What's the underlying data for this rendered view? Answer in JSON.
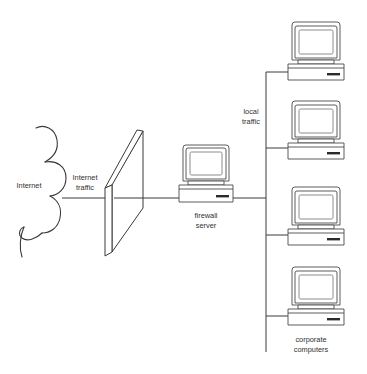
{
  "diagram": {
    "background_color": "#ffffff",
    "line_color": "#3a3a3a",
    "labels": {
      "internet": "Internet",
      "internet_traffic_line1": "Internet",
      "internet_traffic_line2": "traffic",
      "local_traffic_line1": "local",
      "local_traffic_line2": "traffic",
      "firewall_server_line1": "firewall",
      "firewall_server_line2": "server",
      "corporate_computers_line1": "corporate",
      "corporate_computers_line2": "computers"
    },
    "nodes": [
      {
        "id": "internet-cloud",
        "name": "Internet",
        "type": "cloud"
      },
      {
        "id": "firewall-wall",
        "name": "firewall barrier",
        "type": "wall"
      },
      {
        "id": "firewall-server",
        "name": "firewall server",
        "type": "computer"
      },
      {
        "id": "corporate-computer-1",
        "name": "corporate computer 1",
        "type": "computer"
      },
      {
        "id": "corporate-computer-2",
        "name": "corporate computer 2",
        "type": "computer"
      },
      {
        "id": "corporate-computer-3",
        "name": "corporate computer 3",
        "type": "computer"
      },
      {
        "id": "corporate-computer-4",
        "name": "corporate computer 4",
        "type": "computer"
      }
    ],
    "connections": [
      {
        "from": "internet-cloud",
        "to": "firewall-wall",
        "label": "Internet traffic"
      },
      {
        "from": "firewall-wall",
        "to": "firewall-server",
        "label": ""
      },
      {
        "from": "firewall-server",
        "to": "network-bus",
        "label": "local traffic"
      },
      {
        "from": "network-bus",
        "to": "corporate-computer-1",
        "label": ""
      },
      {
        "from": "network-bus",
        "to": "corporate-computer-2",
        "label": ""
      },
      {
        "from": "network-bus",
        "to": "corporate-computer-3",
        "label": ""
      },
      {
        "from": "network-bus",
        "to": "corporate-computer-4",
        "label": ""
      }
    ]
  }
}
